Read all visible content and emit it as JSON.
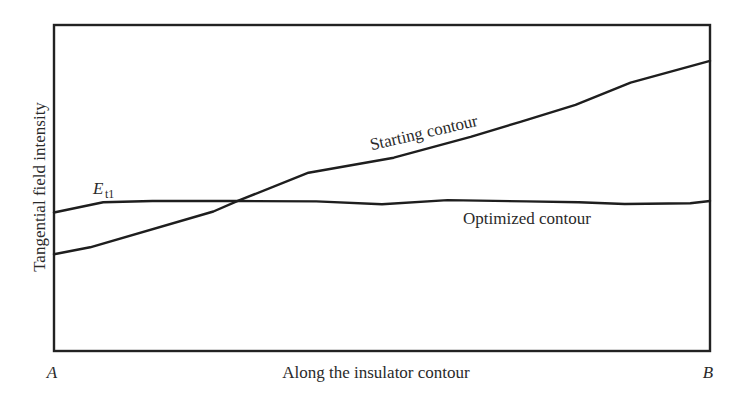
{
  "chart_data": {
    "type": "line",
    "title": "",
    "xlabel": "Along the insulator contour",
    "ylabel": "Tangential field intensity",
    "x_endpoints": {
      "start": "A",
      "end": "B"
    },
    "grid": false,
    "legend": "inline labels on curves",
    "x_range_normalized": [
      0,
      1
    ],
    "y_range_normalized": [
      0,
      1
    ],
    "series": [
      {
        "name": "Starting contour",
        "description": "monotonically increasing from low value at A to maximum at B",
        "x": [
          0.0,
          0.055,
          0.243,
          0.282,
          0.388,
          0.518,
          0.635,
          0.711,
          0.795,
          0.879,
          1.0
        ],
        "y": [
          0.297,
          0.318,
          0.428,
          0.462,
          0.547,
          0.593,
          0.657,
          0.703,
          0.755,
          0.823,
          0.89
        ]
      },
      {
        "name": "Optimized contour",
        "description": "rises briefly near A up to E_t1, then stays nearly flat (uniform) to B",
        "x": [
          0.0,
          0.075,
          0.15,
          0.28,
          0.4,
          0.5,
          0.6,
          0.72,
          0.8,
          0.87,
          0.97,
          1.0
        ],
        "y": [
          0.425,
          0.456,
          0.46,
          0.46,
          0.459,
          0.45,
          0.463,
          0.459,
          0.456,
          0.451,
          0.453,
          0.46
        ]
      }
    ],
    "annotations": [
      {
        "text": "E",
        "subscript": "t1",
        "note": "level of the flat optimized tangential field"
      },
      {
        "text": "Starting contour",
        "attached_to": "Starting contour"
      },
      {
        "text": "Optimized contour",
        "attached_to": "Optimized contour"
      }
    ]
  },
  "labels": {
    "ylabel": "Tangential field intensity",
    "xlabel": "Along the insulator contour",
    "point_a": "A",
    "point_b": "B",
    "starting": "Starting contour",
    "optimized": "Optimized contour",
    "et_main": "E",
    "et_sub": "t1"
  },
  "colors": {
    "line": "#1e1e1e",
    "frame": "#222222",
    "background": "#ffffff"
  }
}
